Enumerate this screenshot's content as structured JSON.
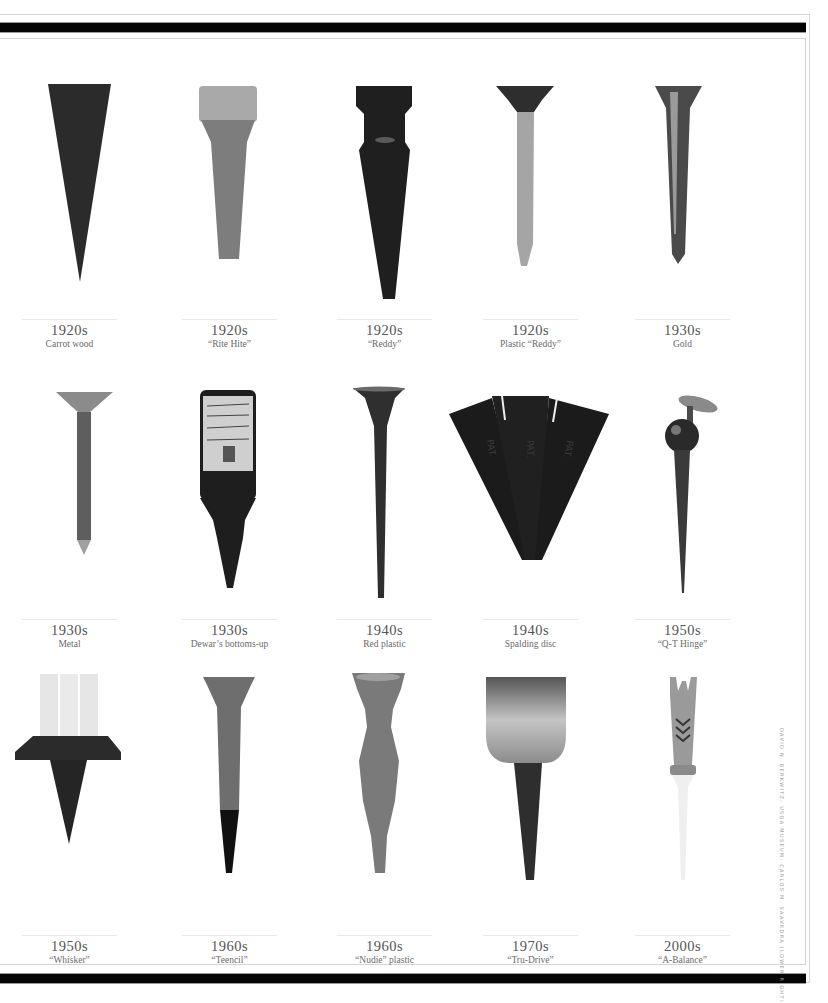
{
  "page": {
    "credit": "DAVID N. BERKWITZ; USGA MUSEUM: CARLOS M. SAAVEDRA (LOWER RIGHT)"
  },
  "tees": [
    {
      "decade": "1920s",
      "label": "Carrot wood",
      "icon": "carrot-wood-tee-icon"
    },
    {
      "decade": "1920s",
      "label": "“Rite Hite”",
      "icon": "rite-hite-tee-icon"
    },
    {
      "decade": "1920s",
      "label": "“Reddy”",
      "icon": "reddy-tee-icon"
    },
    {
      "decade": "1920s",
      "label": "Plastic “Reddy”",
      "icon": "plastic-reddy-tee-icon"
    },
    {
      "decade": "1930s",
      "label": "Gold",
      "icon": "gold-tee-icon"
    },
    {
      "decade": "1930s",
      "label": "Metal",
      "icon": "metal-tee-icon"
    },
    {
      "decade": "1930s",
      "label": "Dewar’s bottoms-up",
      "icon": "dewars-bottle-tee-icon"
    },
    {
      "decade": "1940s",
      "label": "Red plastic",
      "icon": "red-plastic-tee-icon"
    },
    {
      "decade": "1940s",
      "label": "Spalding disc",
      "icon": "spalding-disc-tee-icon"
    },
    {
      "decade": "1950s",
      "label": "“Q-T Hinge”",
      "icon": "qt-hinge-tee-icon"
    },
    {
      "decade": "1950s",
      "label": "“Whisker”",
      "icon": "whisker-tee-icon"
    },
    {
      "decade": "1960s",
      "label": "“Teencil”",
      "icon": "teencil-tee-icon"
    },
    {
      "decade": "1960s",
      "label": "“Nudie” plastic",
      "icon": "nudie-tee-icon"
    },
    {
      "decade": "1970s",
      "label": "“Tru-Drive”",
      "icon": "tru-drive-tee-icon"
    },
    {
      "decade": "2000s",
      "label": "“A-Balance”",
      "icon": "a-balance-tee-icon"
    }
  ]
}
